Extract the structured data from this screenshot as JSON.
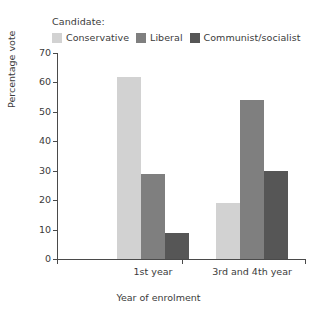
{
  "legend": {
    "title": "Candidate:",
    "entries": [
      {
        "label": "Conservative",
        "color": "#d2d2d2"
      },
      {
        "label": "Liberal",
        "color": "#7f7f7f"
      },
      {
        "label": "Communist/socialist",
        "color": "#565656"
      }
    ]
  },
  "chart_data": {
    "type": "bar",
    "title": "",
    "xlabel": "Year of enrolment",
    "ylabel": "Percentage vote",
    "categories": [
      "1st year",
      "3rd and 4th year"
    ],
    "series": [
      {
        "name": "Conservative",
        "color": "#d2d2d2",
        "values": [
          62,
          19
        ]
      },
      {
        "name": "Liberal",
        "color": "#7f7f7f",
        "values": [
          29,
          54
        ]
      },
      {
        "name": "Communist/socialist",
        "color": "#565656",
        "values": [
          9,
          30
        ]
      }
    ],
    "ylim": [
      0,
      70
    ],
    "yticks": [
      0,
      10,
      20,
      30,
      40,
      50,
      60,
      70
    ],
    "ytick_labels": [
      "0",
      "10",
      "20",
      "30",
      "40",
      "50",
      "60",
      "70"
    ],
    "grid": false,
    "legend_position": "top-left"
  }
}
